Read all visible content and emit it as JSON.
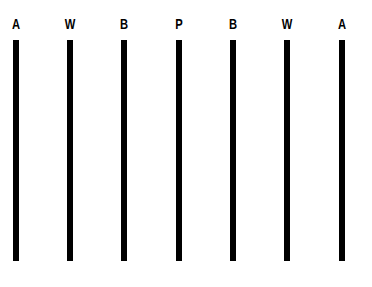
{
  "diagram": {
    "labels": [
      "A",
      "W",
      "B",
      "P",
      "B",
      "W",
      "A"
    ],
    "bar_color": "#000000",
    "background": "#ffffff"
  }
}
